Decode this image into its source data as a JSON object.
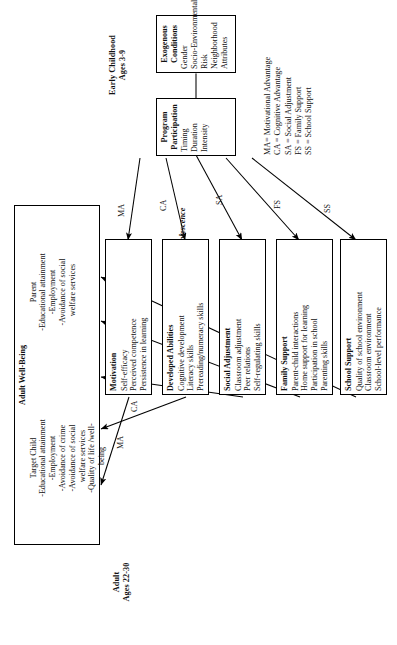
{
  "figure": {
    "stage_labels": {
      "adult": "Adult\nAges 22-30",
      "middle": "Early Childhood to Adolescence",
      "early": "Early Childhood\nAges 3-9"
    },
    "outcome_box": {
      "title": "Adult Well-Being",
      "groups": [
        {
          "name": "Target Child",
          "items": "-Educational attainment\n-Employment\n-Avoidance of crime\n-Avoidance of social\n  welfare services\n-Quality of life /well-\n  being"
        },
        {
          "name": "Parent",
          "items": "-Educational attainment\n-Employment\n-Avoidance of social\n  welfare services"
        }
      ]
    },
    "mediator_boxes": [
      {
        "title": "Motivation",
        "items": "Self-efficacy\nPerceived competence\nPersistence in learning",
        "code": "MA"
      },
      {
        "title": "Developed Abilities",
        "items": "Cognitive development\nLiteracy skills\nPrereading/numeracy skills",
        "code": "CA"
      },
      {
        "title": "Social Adjustment",
        "items": "Classroom adjustment\nPeer relations\nSelf-regulating skills",
        "code": "SA"
      },
      {
        "title": "Family Support",
        "items": "Parent-child interactions\nHome support for learning\nParticipation in school\nParenting skills",
        "code": "FS"
      },
      {
        "title": "School Support",
        "items": "Quality of school environment\nClassroom environment\nSchool-level performance",
        "code": "SS"
      }
    ],
    "input_boxes": [
      {
        "title": "Exogenous\nConditions",
        "items": "Gender\nSocio-Environmental\nRisk\nNeighborhood\nAttributes"
      },
      {
        "title": "Program\nParticipation",
        "items": "Timing\nDuration\nIntensity"
      }
    ],
    "legend": "MA= Motivational Advantage\nCA = Cognitive Advantage\nSA = Social Adjustment\nFS = Family Support\nSS = School Support",
    "arrow_codes_upper": [
      "MA",
      "CA",
      "SA",
      "FS",
      "SS"
    ],
    "arrow_codes_lower": [
      "MA",
      "CA",
      "SA",
      "FS",
      "SS"
    ],
    "colors": {
      "ink": "#000000",
      "paper": "#ffffff"
    }
  }
}
